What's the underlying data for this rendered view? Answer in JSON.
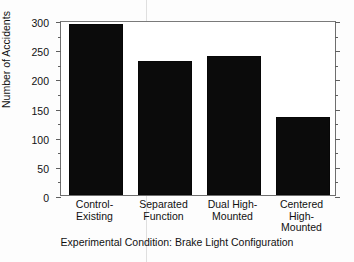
{
  "chart_data": {
    "type": "bar",
    "title": "",
    "xlabel": "Experimental Condition: Brake Light Configuration",
    "ylabel": "Number of Accidents",
    "categories": [
      "Control-\nExisting",
      "Separated\nFunction",
      "Dual High-\nMounted",
      "Centered High-\nMounted"
    ],
    "category_lines": [
      [
        "Control-",
        "Existing"
      ],
      [
        "Separated",
        "Function"
      ],
      [
        "Dual High-",
        "Mounted"
      ],
      [
        "Centered High-",
        "Mounted"
      ]
    ],
    "values": [
      293,
      230,
      238,
      133
    ],
    "ylim": [
      0,
      300
    ],
    "yticks": [
      0,
      50,
      100,
      150,
      200,
      250,
      300
    ],
    "ytick_labels": [
      "0",
      "50",
      "100",
      "150",
      "200",
      "250",
      "300"
    ],
    "yminor_step": 25,
    "grid": false,
    "legend": null,
    "bar_color": "#0b0b0b",
    "axis_color": "#6e6e6e",
    "background": "#ffffff"
  },
  "axes": {
    "y_title": "Number of Accidents",
    "x_title": "Experimental Condition: Brake Light Configuration"
  }
}
